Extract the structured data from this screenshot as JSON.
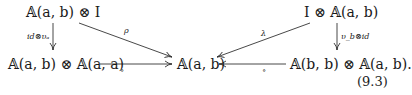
{
  "diagram": {
    "nodes": {
      "top_left": "𝔸(a, b) ⊗ I",
      "top_right": "I ⊗ 𝔸(a, b)",
      "bottom_left": "𝔸(a, b) ⊗ 𝔸(a, a)",
      "center": "𝔸(a, b)",
      "bottom_right": "𝔸(b, b) ⊗ 𝔸(a, b)."
    },
    "arrows": {
      "left_vertical": "id⊗υₐ",
      "right_vertical": "υ_b⊗id",
      "rho": "ρ",
      "lambda": "λ",
      "left_composition": "∘",
      "right_composition": "∘"
    },
    "equation_number": "(9.3)"
  }
}
